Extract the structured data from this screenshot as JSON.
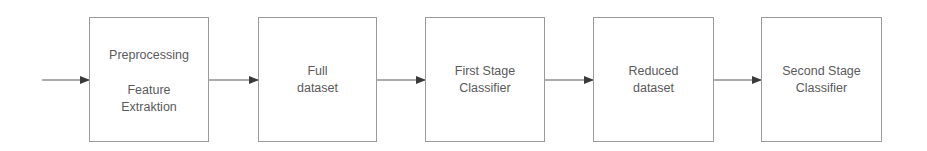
{
  "diagram": {
    "type": "flowchart",
    "direction": "left-to-right",
    "colors": {
      "box_border": "#9a9a9a",
      "text": "#5a5a5a",
      "arrow": "#3a3a3a",
      "background": "#ffffff"
    },
    "input_arrow": {
      "label": ""
    },
    "nodes": [
      {
        "id": "preprocessing",
        "lines": [
          "Preprocessing",
          "Feature",
          "Extraktion"
        ]
      },
      {
        "id": "full-dataset",
        "lines": [
          "Full",
          "dataset"
        ]
      },
      {
        "id": "first-stage-classifier",
        "lines": [
          "First Stage",
          "Classifier"
        ]
      },
      {
        "id": "reduced-dataset",
        "lines": [
          "Reduced",
          "dataset"
        ]
      },
      {
        "id": "second-stage-classifier",
        "lines": [
          "Second Stage",
          "Classifier"
        ]
      }
    ],
    "edges": [
      {
        "from": "input",
        "to": "preprocessing"
      },
      {
        "from": "preprocessing",
        "to": "full-dataset"
      },
      {
        "from": "full-dataset",
        "to": "first-stage-classifier"
      },
      {
        "from": "first-stage-classifier",
        "to": "reduced-dataset"
      },
      {
        "from": "reduced-dataset",
        "to": "second-stage-classifier"
      }
    ]
  }
}
